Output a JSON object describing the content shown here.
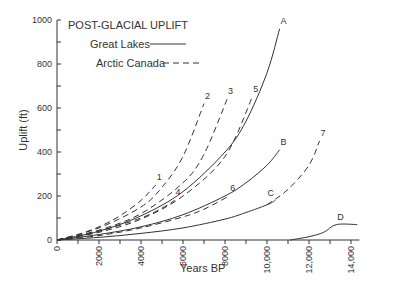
{
  "chart_data": {
    "type": "line",
    "title": "POST-GLACIAL UPLIFT",
    "xlabel": "Years BP",
    "ylabel": "Uplift (ft)",
    "xlim": [
      0,
      14000
    ],
    "ylim": [
      0,
      1000
    ],
    "x_ticks": [
      "0",
      "2000",
      "4000",
      "6000",
      "8000",
      "10,000",
      "12,000",
      "14,000"
    ],
    "y_ticks": [
      "0",
      "200",
      "400",
      "600",
      "800",
      "1000"
    ],
    "grid": false,
    "legend": [
      {
        "label": "Great Lakes",
        "style": "solid"
      },
      {
        "label": "Arctic Canada",
        "style": "dashed"
      }
    ],
    "legend_position": "top-left",
    "series": [
      {
        "name": "A",
        "region": "Great Lakes",
        "style": "solid",
        "x": [
          0,
          2000,
          4000,
          6000,
          8000,
          9000,
          10000,
          10600
        ],
        "y": [
          0,
          40,
          110,
          220,
          400,
          540,
          760,
          960
        ]
      },
      {
        "name": "B",
        "region": "Great Lakes",
        "style": "solid",
        "x": [
          0,
          2000,
          4000,
          6000,
          8000,
          9000,
          10000,
          10600
        ],
        "y": [
          0,
          25,
          60,
          115,
          200,
          260,
          340,
          410
        ]
      },
      {
        "name": "C",
        "region": "Great Lakes",
        "style": "solid",
        "x": [
          0,
          2000,
          4000,
          6000,
          8000,
          9000,
          10000,
          10400
        ],
        "y": [
          0,
          12,
          30,
          55,
          95,
          125,
          160,
          180
        ]
      },
      {
        "name": "D",
        "region": "Great Lakes",
        "style": "solid",
        "x": [
          11100,
          12000,
          12700,
          13300,
          14300
        ],
        "y": [
          0,
          15,
          35,
          70,
          70
        ]
      },
      {
        "name": "1",
        "region": "Arctic Canada",
        "style": "dashed",
        "x": [
          0,
          1000,
          2000,
          3000,
          4000,
          4700
        ],
        "y": [
          0,
          25,
          60,
          110,
          180,
          250
        ]
      },
      {
        "name": "2",
        "region": "Arctic Canada",
        "style": "dashed",
        "x": [
          0,
          2000,
          4000,
          5000,
          6000,
          7000
        ],
        "y": [
          0,
          55,
          150,
          240,
          380,
          620
        ]
      },
      {
        "name": "3",
        "region": "Arctic Canada",
        "style": "dashed",
        "x": [
          0,
          2000,
          4000,
          6000,
          7000,
          8100
        ],
        "y": [
          0,
          45,
          120,
          260,
          390,
          640
        ]
      },
      {
        "name": "4",
        "region": "Arctic Canada",
        "style": "dashed",
        "x": [
          0,
          2000,
          4000,
          5000,
          5600
        ],
        "y": [
          0,
          40,
          100,
          145,
          180
        ]
      },
      {
        "name": "5",
        "region": "Arctic Canada",
        "style": "dashed",
        "x": [
          0,
          2000,
          4000,
          6000,
          8000,
          9300
        ],
        "y": [
          0,
          35,
          95,
          200,
          380,
          650
        ]
      },
      {
        "name": "6",
        "region": "Arctic Canada",
        "style": "dashed",
        "x": [
          0,
          2000,
          4000,
          6000,
          7000,
          8200
        ],
        "y": [
          0,
          20,
          55,
          105,
          140,
          200
        ]
      },
      {
        "name": "7",
        "region": "Arctic Canada",
        "style": "dashed",
        "x": [
          10000,
          11000,
          12000,
          12500
        ],
        "y": [
          160,
          230,
          340,
          450
        ]
      }
    ]
  },
  "labels": {
    "title": "POST-GLACIAL UPLIFT",
    "legend_great_lakes": "Great Lakes",
    "legend_arctic_canada": "Arctic Canada",
    "xlabel": "Years BP",
    "ylabel": "Uplift (ft)"
  }
}
